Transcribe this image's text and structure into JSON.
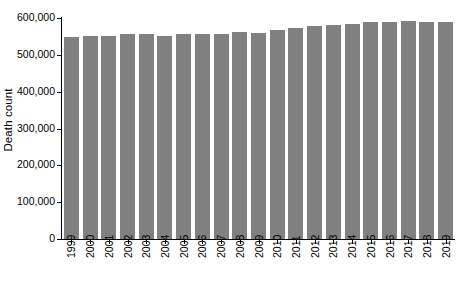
{
  "chart_data": {
    "type": "bar",
    "title": "",
    "xlabel": "",
    "ylabel": "Death count",
    "ylim": [
      0,
      600000
    ],
    "ytick_labels": [
      "0",
      "100,000",
      "200,000",
      "300,000",
      "400,000",
      "500,000",
      "600,000"
    ],
    "ytick_values": [
      0,
      100000,
      200000,
      300000,
      400000,
      500000,
      600000
    ],
    "grid": false,
    "legend": null,
    "bar_color": "#808080",
    "categories": [
      "1999",
      "2000",
      "2001",
      "2002",
      "2003",
      "2004",
      "2005",
      "2006",
      "2007",
      "2008",
      "2009",
      "2010",
      "2011",
      "2012",
      "2013",
      "2014",
      "2015",
      "2016",
      "2017",
      "2018",
      "2019"
    ],
    "values": [
      548000,
      551000,
      551000,
      556000,
      556000,
      550000,
      556000,
      557000,
      556000,
      562000,
      560000,
      568000,
      573000,
      577000,
      580000,
      585000,
      589000,
      589000,
      591000,
      590000,
      590000
    ]
  },
  "axis": {
    "y_title": "Death count"
  }
}
